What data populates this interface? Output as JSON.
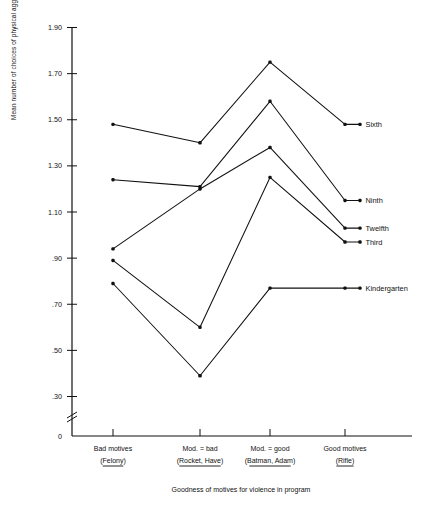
{
  "chart_data": {
    "type": "line",
    "title": "",
    "xlabel": "Goodness of motives for violence in program",
    "ylabel": "Mean number of choices of physical aggression",
    "categories": [
      "Bad motives\n(Felony)",
      "Mod. = bad\n(Rocket, Have)",
      "Mod. = good\n(Batman, Adam)",
      "Good motives\n(Rifle)"
    ],
    "category_lines": [
      {
        "top": "Bad motives",
        "bottom": "(Felony)",
        "underline": "Felony"
      },
      {
        "top": "Mod. = bad",
        "bottom": "(Rocket, Have)",
        "underline": "Rocket, Have"
      },
      {
        "top": "Mod. = good",
        "bottom": "(Batman, Adam)",
        "underline": "Batman, Adam"
      },
      {
        "top": "Good motives",
        "bottom": "(Rifle)",
        "underline": "Rifle"
      }
    ],
    "ylim": [
      0,
      1.9
    ],
    "yticks": [
      1.9,
      1.7,
      1.5,
      1.3,
      1.1,
      0.9,
      0.7,
      0.5,
      0.3,
      0
    ],
    "ytick_labels": [
      "1.90",
      "1.70",
      "1.50",
      "1.30",
      "1.10",
      ".90",
      ".70",
      ".50",
      ".30",
      "0"
    ],
    "axis_break": true,
    "grid": false,
    "legend_position": "right-inline-endpoint-labels",
    "series": [
      {
        "name": "Sixth",
        "values": [
          1.48,
          1.4,
          1.75,
          1.48
        ]
      },
      {
        "name": "Ninth",
        "values": [
          1.24,
          1.21,
          1.58,
          1.15
        ]
      },
      {
        "name": "Twelfth",
        "values": [
          0.94,
          1.2,
          1.38,
          1.03
        ]
      },
      {
        "name": "Third",
        "values": [
          0.89,
          0.6,
          1.25,
          0.97
        ]
      },
      {
        "name": "Kindergarten",
        "values": [
          0.79,
          0.39,
          0.77,
          0.77
        ]
      }
    ]
  },
  "axis": {
    "y_title": "Mean number of choices of physical aggression",
    "x_title": "Goodness of motives for violence in program"
  }
}
